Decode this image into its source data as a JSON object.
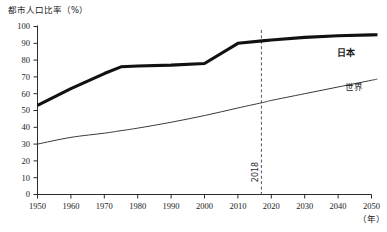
{
  "chart_data": {
    "type": "line",
    "title": "都市人口比率（%）",
    "xlabel": "（年）",
    "ylabel": "都市人口比率（%）",
    "xlim": [
      1950,
      2050
    ],
    "ylim": [
      0,
      100
    ],
    "grid": false,
    "legend_position": "inline-right",
    "x": [
      1950,
      1960,
      1970,
      1975,
      1980,
      1990,
      2000,
      2010,
      2018,
      2020,
      2030,
      2040,
      2050
    ],
    "xticks": [
      "1950",
      "1960",
      "1970",
      "1980",
      "1990",
      "2000",
      "2010",
      "2020",
      "2030",
      "2040",
      "2050"
    ],
    "yticks": [
      "0",
      "10",
      "20",
      "30",
      "40",
      "50",
      "60",
      "70",
      "80",
      "90",
      "100"
    ],
    "series": [
      {
        "name": "日本",
        "label": "日本",
        "style": "thick",
        "color": "#111111",
        "values": [
          53,
          63,
          72,
          76,
          76.5,
          77,
          78,
          90,
          91.6,
          92,
          93.5,
          94.5,
          95
        ]
      },
      {
        "name": "世界",
        "label": "世界",
        "style": "thin",
        "color": "#3a3a3a",
        "values": [
          30,
          34,
          36.5,
          38,
          39.5,
          43,
          47,
          51.5,
          55,
          56,
          60,
          64,
          68
        ]
      }
    ],
    "annotations": [
      {
        "type": "vertical-line",
        "x": 2018,
        "label": "2018",
        "rotated": true,
        "style": "dashed"
      }
    ]
  }
}
